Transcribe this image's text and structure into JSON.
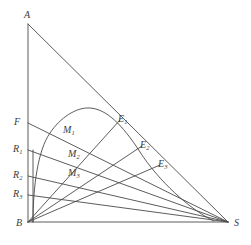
{
  "figure": {
    "kind": "geometric-diagram",
    "background_color": "#ffffff",
    "line_color": "#4a4a4a",
    "text_color": "#3c3c3c",
    "width": 251,
    "height": 245
  },
  "vertices": [
    {
      "id": "A",
      "label": "A",
      "x": 28,
      "y": 24,
      "label_x": 24,
      "label_y": 10
    },
    {
      "id": "B",
      "label": "B",
      "x": 28,
      "y": 222,
      "label_x": 16,
      "label_y": 218
    },
    {
      "id": "S",
      "label": "S",
      "x": 228,
      "y": 222,
      "label_x": 234,
      "label_y": 218
    }
  ],
  "left_axis_points": [
    {
      "id": "F",
      "label": "F",
      "sub": "",
      "x": 28,
      "y": 123,
      "label_x": 14,
      "label_y": 117
    },
    {
      "id": "R1",
      "label": "R",
      "sub": "1",
      "x": 28,
      "y": 150,
      "label_x": 13,
      "label_y": 144
    },
    {
      "id": "R2",
      "label": "R",
      "sub": "2",
      "x": 28,
      "y": 176,
      "label_x": 13,
      "label_y": 170
    },
    {
      "id": "R3",
      "label": "R",
      "sub": "3",
      "x": 28,
      "y": 195,
      "label_x": 13,
      "label_y": 189
    }
  ],
  "hypotenuse_points": [
    {
      "id": "E1",
      "label": "E",
      "sub": "1",
      "x": 120,
      "y": 120,
      "label_x": 118,
      "label_y": 114
    },
    {
      "id": "E2",
      "label": "E",
      "sub": "2",
      "x": 142,
      "y": 146,
      "label_x": 140,
      "label_y": 140
    },
    {
      "id": "E3",
      "label": "E",
      "sub": "3",
      "x": 160,
      "y": 165,
      "label_x": 158,
      "label_y": 159
    }
  ],
  "midpoints": [
    {
      "id": "M1",
      "label": "M",
      "sub": "1",
      "x": 68,
      "y": 131,
      "label_x": 63,
      "label_y": 125
    },
    {
      "id": "M2",
      "label": "M",
      "sub": "2",
      "x": 72,
      "y": 155,
      "label_x": 68,
      "label_y": 149
    },
    {
      "id": "M3",
      "label": "M",
      "sub": "3",
      "x": 72,
      "y": 174,
      "label_x": 68,
      "label_y": 168
    }
  ],
  "segments": [
    {
      "name": "side-AB",
      "from": "A",
      "to": "B",
      "d": "M 28 24 L 28 222"
    },
    {
      "name": "side-BS",
      "from": "B",
      "to": "S",
      "d": "M 28 222 L 228 222"
    },
    {
      "name": "side-AS",
      "from": "A",
      "to": "S",
      "d": "M 28 24 L 228 222"
    },
    {
      "name": "ray-F-S",
      "from": "F",
      "to": "S",
      "d": "M 28 123 L 228 222"
    },
    {
      "name": "ray-R1-S",
      "from": "R1",
      "to": "S",
      "d": "M 28 150 L 228 222"
    },
    {
      "name": "ray-R2-S",
      "from": "R2",
      "to": "S",
      "d": "M 28 176 L 228 222"
    },
    {
      "name": "ray-R3-S",
      "from": "R3",
      "to": "S",
      "d": "M 28 195 L 228 222"
    },
    {
      "name": "ray-B-E1",
      "from": "B",
      "to": "E1",
      "d": "M 28 222 L 120 120"
    },
    {
      "name": "ray-B-E2",
      "from": "B",
      "to": "E2",
      "d": "M 28 222 L 142 146"
    },
    {
      "name": "ray-B-E3",
      "from": "B",
      "to": "E3",
      "d": "M 28 222 L 160 165"
    }
  ],
  "curve": {
    "name": "yield-curve",
    "d": "M 33 222 C 33 186 38 150 50 133 C 60 118 76 107 90 108 C 106 109 122 124 140 152 C 158 180 190 210 214 221"
  },
  "inner_vertical": {
    "name": "curve-base-line",
    "d": "M 33 222 L 33 150"
  }
}
